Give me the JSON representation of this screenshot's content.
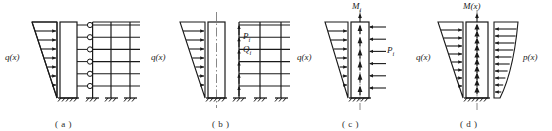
{
  "figure": {
    "type": "structural-engineering-diagram",
    "stroke_color": "#1a1a1a",
    "fill_color": "#ffffff"
  },
  "panels": [
    {
      "id": "a",
      "caption": "( a )",
      "labels": {
        "load": "q(x)"
      },
      "description": "triangular distributed load on coupled shear wall and frame with hinged links",
      "stories": 6,
      "frame_bays": 3
    },
    {
      "id": "b",
      "caption": "( b )",
      "labels": {
        "load": "q(x)",
        "force_p": "P",
        "force_p_sub": "i",
        "force_q": "Q",
        "force_q_sub": "i"
      },
      "description": "separated shear wall and frame with interaction forces",
      "stories": 6,
      "frame_bays": 3
    },
    {
      "id": "c",
      "caption": "( c )",
      "labels": {
        "moment": "M",
        "moment_sub": "i",
        "load": "q(x)",
        "force_p": "P",
        "force_p_sub": "i"
      },
      "description": "isolated shear wall with top moment and discrete interaction forces",
      "stories": 6
    },
    {
      "id": "d",
      "caption": "( d )",
      "labels": {
        "moment": "M(x)",
        "load_left": "q(x)",
        "load_right": "p(x)"
      },
      "description": "continuum model with continuous distributed interaction force",
      "stories": 6
    }
  ]
}
